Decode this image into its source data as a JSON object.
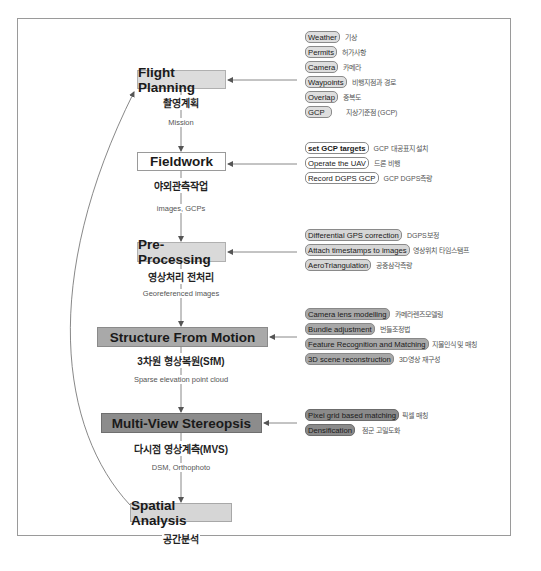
{
  "diagram": {
    "stages": [
      {
        "id": "flight-planning",
        "label": "Flight Planning",
        "label_ko": "촬영계획"
      },
      {
        "id": "fieldwork",
        "label": "Fieldwork",
        "label_ko": "야외관측작업"
      },
      {
        "id": "pre-processing",
        "label": "Pre-Processing",
        "label_ko": "영상처리 전처리"
      },
      {
        "id": "sfm",
        "label": "Structure From Motion",
        "label_ko": "3차원 형상복원(SfM)"
      },
      {
        "id": "mvs",
        "label": "Multi-View Stereopsis",
        "label_ko": "다시점 영상계측(MVS)"
      },
      {
        "id": "spatial-analysis",
        "label": "Spatial Analysis",
        "label_ko": "공간분석"
      }
    ],
    "edges": [
      {
        "from": "flight-planning",
        "to": "fieldwork",
        "label": "Mission"
      },
      {
        "from": "fieldwork",
        "to": "pre-processing",
        "label": "images, GCPs"
      },
      {
        "from": "pre-processing",
        "to": "sfm",
        "label": "Georeferenced images"
      },
      {
        "from": "sfm",
        "to": "mvs",
        "label": "Sparse elevation point cloud"
      },
      {
        "from": "mvs",
        "to": "spatial-analysis",
        "label": "DSM, Orthophoto"
      },
      {
        "from": "spatial-analysis",
        "to": "flight-planning",
        "label": ""
      }
    ],
    "groups": [
      {
        "stage": "flight-planning",
        "items": [
          {
            "label": "Weather",
            "label_ko": "기상"
          },
          {
            "label": "Permits",
            "label_ko": "허가사항"
          },
          {
            "label": "Camera",
            "label_ko": "카메라"
          },
          {
            "label": "Waypoints",
            "label_ko": "비행지점과 경로"
          },
          {
            "label": "Overlap",
            "label_ko": "중복도"
          },
          {
            "label": "GCP",
            "label_ko": "지상기준점 (GCP)"
          }
        ]
      },
      {
        "stage": "fieldwork",
        "items": [
          {
            "label": "set GCP targets",
            "label_ko": "GCP 대공표지 설치"
          },
          {
            "label": "Operate the UAV",
            "label_ko": "드론 비행"
          },
          {
            "label": "Record DGPS GCP",
            "label_ko": "GCP DGPS측량"
          }
        ]
      },
      {
        "stage": "pre-processing",
        "items": [
          {
            "label": "Differential GPS correction",
            "label_ko": "DGPS보정"
          },
          {
            "label": "Attach timestamps to images",
            "label_ko": "영상위치 타임스탬프"
          },
          {
            "label": "AeroTriangulation",
            "label_ko": "공중삼각측량"
          }
        ]
      },
      {
        "stage": "sfm",
        "items": [
          {
            "label": "Camera lens modelling",
            "label_ko": "카메라렌즈모델링"
          },
          {
            "label": "Bundle adjustment",
            "label_ko": "번들조정법"
          },
          {
            "label": "Feature Recognition and Matching",
            "label_ko": "지물인식 및 매칭"
          },
          {
            "label": "3D scene reconstruction",
            "label_ko": "3D영상 재구성"
          }
        ]
      },
      {
        "stage": "mvs",
        "items": [
          {
            "label": "Pixel grid based matching",
            "label_ko": "픽셀 매칭"
          },
          {
            "label": "Densification",
            "label_ko": "점군 고밀도화"
          }
        ]
      }
    ],
    "colors": {
      "frame": "#9a9a9a",
      "stage_light": "#dcdcdc",
      "stage_white": "#ffffff",
      "stage_mid": "#a9a9a9",
      "stage_dark": "#8c8c8c",
      "line": "#6a6a6a"
    }
  }
}
